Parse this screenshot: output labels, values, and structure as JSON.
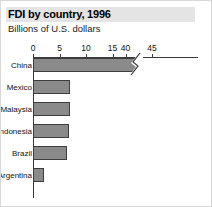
{
  "chart_data": {
    "type": "bar",
    "orientation": "horizontal",
    "title": "FDI by country, 1996",
    "subtitle": "Billions of U.S. dollars",
    "xlabel": "",
    "ylabel": "",
    "categories": [
      "China",
      "Mexico",
      "Malaysia",
      "Indonesia",
      "Brazil",
      "Argentina"
    ],
    "values": [
      43.3,
      7.0,
      7.0,
      6.8,
      6.4,
      2.1
    ],
    "tick_labels": [
      "0",
      "5",
      "10",
      "15",
      "40",
      "45"
    ],
    "tick_values": [
      0,
      5,
      10,
      15,
      40,
      45
    ],
    "xlim": [
      0,
      45
    ],
    "axis_break": {
      "from": 15,
      "to": 40
    },
    "grid": false,
    "legend": "none",
    "bar_fill_color": "#8a8a8a",
    "bar_edge_color": "#3d3d3d",
    "axis_color": "#3a3a3a",
    "title_band_color": "#e4e4e4"
  }
}
